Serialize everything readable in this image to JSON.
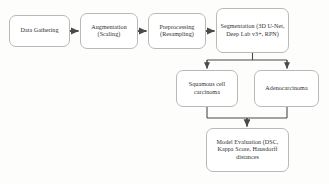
{
  "diagram": {
    "background_color": "#fdfdfc",
    "node_border_color": "#b9b9b9",
    "connector_color": "#4a4a4a",
    "text_color": "#2f2f2f",
    "nodes": [
      {
        "id": "data-gathering",
        "label": "Data Gathering"
      },
      {
        "id": "augmentation",
        "label": "Augmentation\n(Scaling)"
      },
      {
        "id": "preprocessing",
        "label": "Preprocessing\n(Resampling)"
      },
      {
        "id": "segmentation",
        "label": "Segmentation (3D U-Net, Deep Lab v3+, RPN)"
      },
      {
        "id": "squamous-cell-carcinoma",
        "label": "Squamous cell\ncarcinoma"
      },
      {
        "id": "adenocarcinoma",
        "label": "Adenocarcinoma"
      },
      {
        "id": "model-evaluation",
        "label": "Model Evaluation (DSC, Kappa Score, Hausdorff distances"
      }
    ],
    "connectors": [
      {
        "id": "data-gathering-to-augmentation",
        "type": "arrow-right"
      },
      {
        "id": "augmentation-to-preprocessing",
        "type": "arrow-right"
      },
      {
        "id": "preprocessing-to-segmentation",
        "type": "arrow-right"
      },
      {
        "id": "segmentation-to-squamous",
        "type": "arrow-down-split"
      },
      {
        "id": "segmentation-to-adenocarcinoma",
        "type": "arrow-down-split"
      },
      {
        "id": "squamous-to-evaluation",
        "type": "arrow-down-merge"
      },
      {
        "id": "adenocarcinoma-to-evaluation",
        "type": "arrow-down-merge"
      }
    ]
  }
}
